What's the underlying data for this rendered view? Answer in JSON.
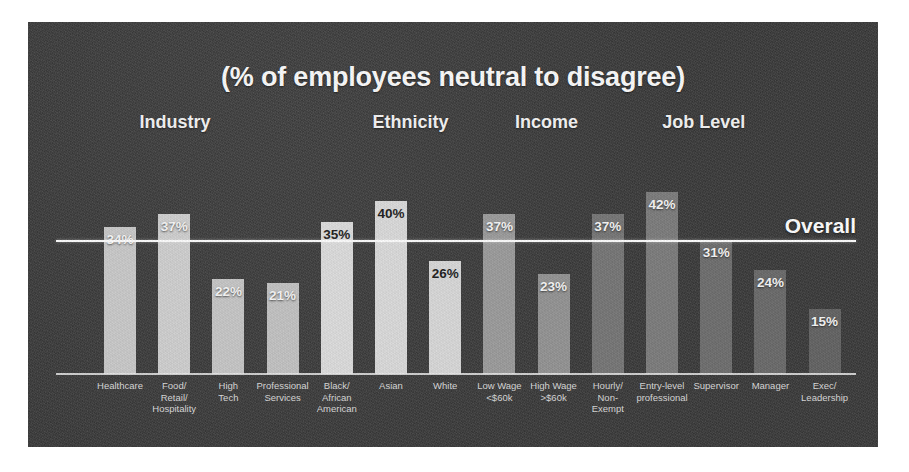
{
  "slide": {
    "title": "(% of employees neutral to disagree)",
    "panel_background": "#3a3a3a",
    "page_background": "#ffffff"
  },
  "overall": {
    "label": "Overall",
    "value": 31,
    "line_color": "#fdfdfd"
  },
  "groups": [
    {
      "label": "Industry",
      "left_pct": 17.3
    },
    {
      "label": "Ethnicity",
      "left_pct": 45.0
    },
    {
      "label": "Income",
      "left_pct": 61.0
    },
    {
      "label": "Job Level",
      "left_pct": 79.5
    }
  ],
  "chart_data": {
    "type": "bar",
    "title": "(% of employees neutral to disagree)",
    "xlabel": "",
    "ylabel": "",
    "ylim": [
      0,
      46
    ],
    "grid": false,
    "legend": "none",
    "value_suffix": "%",
    "reference_line": {
      "name": "Overall",
      "value": 31
    },
    "groups": [
      "Industry",
      "Ethnicity",
      "Income",
      "Job Level"
    ],
    "categories": [
      "Healthcare",
      "Food/ Retail/ Hospitality",
      "High Tech",
      "Professional Services",
      "Black/ African American",
      "Asian",
      "White",
      "Low Wage <$60k",
      "High Wage >$60k",
      "Hourly/ Non- Exempt",
      "Entry-level professional",
      "Supervisor",
      "Manager",
      "Exec/ Leadership"
    ],
    "values": [
      34,
      37,
      22,
      21,
      35,
      40,
      26,
      37,
      23,
      37,
      42,
      31,
      24,
      15
    ]
  },
  "bars": [
    {
      "tick": "Healthcare",
      "value_label": "34%",
      "value": 34,
      "group": "Industry",
      "color": "#c9c9c9",
      "label_tone": "on-dark"
    },
    {
      "tick": "Food/\nRetail/\nHospitality",
      "value_label": "37%",
      "value": 37,
      "group": "Industry",
      "color": "#cfcfcf",
      "label_tone": "on-dark"
    },
    {
      "tick": "High\nTech",
      "value_label": "22%",
      "value": 22,
      "group": "Industry",
      "color": "#c6c6c6",
      "label_tone": "on-dark"
    },
    {
      "tick": "Professional\nServices",
      "value_label": "21%",
      "value": 21,
      "group": "Industry",
      "color": "#c2c2c2",
      "label_tone": "on-dark"
    },
    {
      "tick": "Black/\nAfrican\nAmerican",
      "value_label": "35%",
      "value": 35,
      "group": "Ethnicity",
      "color": "#dcdcdc",
      "label_tone": "on-light"
    },
    {
      "tick": "Asian",
      "value_label": "40%",
      "value": 40,
      "group": "Ethnicity",
      "color": "#dadada",
      "label_tone": "on-light"
    },
    {
      "tick": "White",
      "value_label": "26%",
      "value": 26,
      "group": "Ethnicity",
      "color": "#d8d8d8",
      "label_tone": "on-light"
    },
    {
      "tick": "Low Wage\n<$60k",
      "value_label": "37%",
      "value": 37,
      "group": "Income",
      "color": "#9b9b9b",
      "label_tone": "on-dark"
    },
    {
      "tick": "High Wage\n>$60k",
      "value_label": "23%",
      "value": 23,
      "group": "Income",
      "color": "#939393",
      "label_tone": "on-dark"
    },
    {
      "tick": "Hourly/\nNon-\nExempt",
      "value_label": "37%",
      "value": 37,
      "group": "Job Level",
      "color": "#767676",
      "label_tone": "on-dark"
    },
    {
      "tick": "Entry-level\nprofessional",
      "value_label": "42%",
      "value": 42,
      "group": "Job Level",
      "color": "#7c7c7c",
      "label_tone": "on-dark"
    },
    {
      "tick": "Supervisor",
      "value_label": "31%",
      "value": 31,
      "group": "Job Level",
      "color": "#6e6e6e",
      "label_tone": "on-dark"
    },
    {
      "tick": "Manager",
      "value_label": "24%",
      "value": 24,
      "group": "Job Level",
      "color": "#6a6a6a",
      "label_tone": "on-dark"
    },
    {
      "tick": "Exec/\nLeadership",
      "value_label": "15%",
      "value": 15,
      "group": "Job Level",
      "color": "#636363",
      "label_tone": "on-dark"
    }
  ]
}
